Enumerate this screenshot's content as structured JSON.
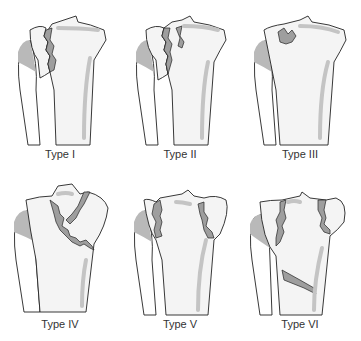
{
  "figure": {
    "panels": [
      {
        "id": "type-1",
        "label": "Type I"
      },
      {
        "id": "type-2",
        "label": "Type II"
      },
      {
        "id": "type-3",
        "label": "Type III"
      },
      {
        "id": "type-4",
        "label": "Type IV"
      },
      {
        "id": "type-5",
        "label": "Type V"
      },
      {
        "id": "type-6",
        "label": "Type VI"
      }
    ],
    "colors": {
      "background": "#ffffff",
      "bone_fill": "#f4f4f4",
      "outline": "#222222",
      "fracture_gap": "#9e9e9e",
      "shadow": "#b9b9b9"
    }
  }
}
